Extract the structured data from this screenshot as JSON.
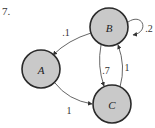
{
  "problem_number": "7.",
  "nodes": [
    {
      "id": "A",
      "label": "A",
      "cx": 41,
      "cy": 69,
      "r": 19
    },
    {
      "id": "B",
      "label": "B",
      "cx": 109,
      "cy": 27,
      "r": 19
    },
    {
      "id": "C",
      "label": "C",
      "cx": 112,
      "cy": 104,
      "r": 19
    }
  ],
  "edges": [
    {
      "from": "B",
      "to": "A",
      "label": ".1"
    },
    {
      "from": "B",
      "to": "B",
      "label": ".2"
    },
    {
      "from": "B",
      "to": "C",
      "label": ".7"
    },
    {
      "from": "C",
      "to": "B",
      "label": "1"
    },
    {
      "from": "A",
      "to": "C",
      "label": "1"
    }
  ],
  "colors": {
    "node_fill": "#c9c9c9",
    "node_stroke": "#2a2a2a",
    "edge": "#555555"
  }
}
